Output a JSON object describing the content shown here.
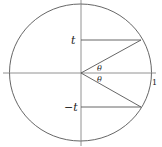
{
  "diagram": {
    "labels": {
      "t_upper": "t",
      "t_lower": "−t",
      "theta_upper": "θ",
      "theta_lower": "θ",
      "radius_marker": "1"
    },
    "colors": {
      "stroke": "#555555",
      "text": "#222222"
    }
  }
}
